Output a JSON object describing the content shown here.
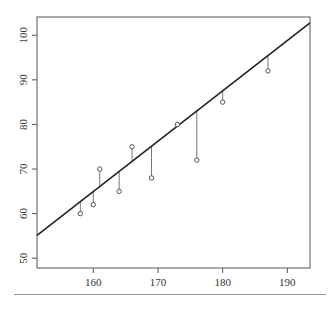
{
  "chart_data": {
    "type": "scatter",
    "title": "",
    "xlabel": "",
    "ylabel": "",
    "xlim": [
      151.3,
      193.5
    ],
    "ylim": [
      47.8,
      104.1
    ],
    "xticks": [
      160,
      170,
      180,
      190
    ],
    "yticks": [
      50,
      60,
      70,
      80,
      90,
      100
    ],
    "grid": false,
    "legend": null,
    "points": [
      {
        "x": 158,
        "y": 60
      },
      {
        "x": 160,
        "y": 62
      },
      {
        "x": 161,
        "y": 70
      },
      {
        "x": 164,
        "y": 65
      },
      {
        "x": 166,
        "y": 75
      },
      {
        "x": 169,
        "y": 68
      },
      {
        "x": 173,
        "y": 80
      },
      {
        "x": 176,
        "y": 72
      },
      {
        "x": 180,
        "y": 85
      },
      {
        "x": 187,
        "y": 92
      }
    ],
    "regression_line": {
      "x0": 151.3,
      "y0": 55.1,
      "x1": 193.5,
      "y1": 102.8
    },
    "annotations": [
      "vertical residual segments from each point to fitted line"
    ]
  },
  "colors": {
    "axis": "#555555",
    "line": "#222222",
    "points": "#555555",
    "residuals": "#777777",
    "separator": "#9a9a9a"
  }
}
